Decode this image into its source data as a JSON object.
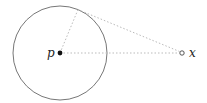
{
  "diagram": {
    "circle": {
      "cx": 60,
      "cy": 53,
      "r": 47,
      "stroke": "#777777"
    },
    "center_point": {
      "label": "p",
      "x": 60,
      "y": 53,
      "fill": "#111111"
    },
    "external_point": {
      "label": "x",
      "x": 182,
      "y": 53,
      "style": "open"
    },
    "tangent_point": {
      "x": 78,
      "y": 9.6
    },
    "dotted_lines": [
      {
        "name": "p-to-x",
        "from": "p",
        "to": "x"
      },
      {
        "name": "p-to-tangent",
        "from": "p",
        "to": "tangent"
      },
      {
        "name": "tangent-to-x",
        "from": "tangent",
        "to": "x"
      }
    ],
    "dotted_color": "#bbbbbb"
  }
}
